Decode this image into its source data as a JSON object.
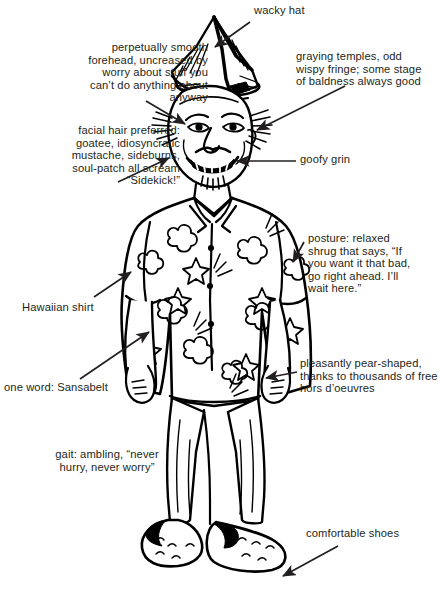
{
  "page": {
    "width": 438,
    "height": 601,
    "background_color": "#ffffff",
    "ink_color": "#231f20"
  },
  "illustration": {
    "subject": "cartoon line drawing of a smiling middle-aged man wearing a wacky folded paper hat, a floral Hawaiian shirt, loose trousers and sandals, standing with arms at his sides in a relaxed shrug",
    "style": "black-and-white pen-and-ink cartoon"
  },
  "callouts": [
    {
      "id": "wacky-hat",
      "text": "wacky hat",
      "align": "left",
      "arrow": {
        "from": [
          249,
          23
        ],
        "to": [
          214,
          47
        ]
      }
    },
    {
      "id": "forehead",
      "text": "perpetually smooth\nforehead, uncreased by\nworry about stuff you\ncan’t do anything about\nanyway",
      "align": "right",
      "arrow": {
        "from": [
          146,
          101
        ],
        "to": [
          184,
          124
        ]
      }
    },
    {
      "id": "graying-temples",
      "text": "graying temples, odd\nwispy fringe; some stage\nof baldness always good",
      "align": "left",
      "arrow": {
        "from": [
          344,
          88
        ],
        "to": [
          256,
          131
        ]
      }
    },
    {
      "id": "facial-hair",
      "text": "facial hair preferred:\ngoatee, idiosyncratic\nmustache, sideburns,\nsoul-patch all scream\n“Sidekick!”",
      "align": "right",
      "arrow": {
        "from": [
          118,
          181
        ],
        "to": [
          168,
          158
        ]
      }
    },
    {
      "id": "goofy-grin",
      "text": "goofy grin",
      "align": "left",
      "arrow": {
        "from": [
          295,
          161
        ],
        "to": [
          236,
          161
        ]
      }
    },
    {
      "id": "posture",
      "text": "posture: relaxed\nshrug that says, “If\nyou want it that bad,\ngo right ahead. I’ll\nwait here.”",
      "align": "left",
      "arrow": {
        "from": [
          303,
          243
        ],
        "to": [
          292,
          262
        ]
      }
    },
    {
      "id": "hawaiian-shirt",
      "text": "Hawaiian shirt",
      "align": "left",
      "arrow": {
        "from": [
          95,
          296
        ],
        "to": [
          130,
          272
        ]
      }
    },
    {
      "id": "sansabelt",
      "text": "one word: Sansabelt",
      "align": "left",
      "arrow": {
        "from": [
          80,
          378
        ],
        "to": [
          148,
          333
        ]
      }
    },
    {
      "id": "pear-shaped",
      "text": "pleasantly pear-shaped,\nthanks to thousands of free\nhors d’oeuvres",
      "align": "left",
      "arrow": {
        "from": [
          296,
          372
        ],
        "to": [
          265,
          378
        ]
      }
    },
    {
      "id": "gait",
      "text": "gait: ambling, “never\nhurry, never worry”",
      "align": "center",
      "arrow": null
    },
    {
      "id": "comfortable-shoes",
      "text": "comfortable shoes",
      "align": "left",
      "arrow": {
        "from": [
          337,
          547
        ],
        "to": [
          282,
          577
        ]
      }
    }
  ]
}
